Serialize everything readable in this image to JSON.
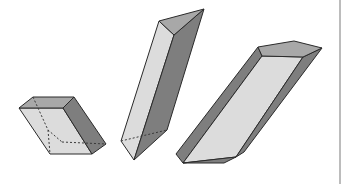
{
  "figure": {
    "caption": "Three prisms in oblique projection",
    "colors": {
      "light_face": "#dcdcdc",
      "mid_face": "#a8a8a8",
      "dark_face": "#7e7e7e",
      "edge": "#2a2a2a",
      "divider": "#bcbcbc"
    },
    "shapes": [
      {
        "name": "rectangular-prism",
        "faces": {
          "front": "19,108 63,108 92,154 50,154",
          "top": "19,108 33,97 74,97 63,108",
          "right": "63,108 74,97 106,144 92,154"
        },
        "hidden_edges": [
          "33,97 48,130 62,142",
          "48,130 50,154",
          "62,142 106,144"
        ]
      },
      {
        "name": "triangular-prism-tall",
        "faces": {
          "left": "159,21 174,35 134,160 121,141",
          "right": "174,35 204,9 167,130 134,160",
          "top": "159,21 204,9 174,35"
        },
        "hidden_edges": [
          "121,141 167,130"
        ]
      },
      {
        "name": "trough-prism",
        "faces": {
          "left_wall": "258,47 262,56 183,163 176,154",
          "floor": "262,56 303,57 236,157 183,163",
          "right_wall": "303,57 322,48 244,152 236,157",
          "top": "258,47 294,41 322,48 303,57 262,56",
          "bottom_cap": "183,163 224,163 236,157"
        },
        "hidden_edges": []
      }
    ]
  }
}
